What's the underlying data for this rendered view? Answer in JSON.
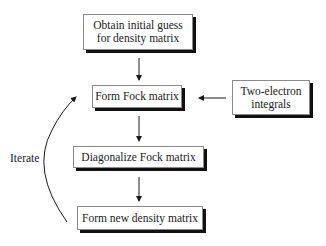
{
  "diagram": {
    "type": "flowchart",
    "nodes": [
      {
        "id": "initial",
        "lines": [
          "Obtain initial guess",
          "for density matrix"
        ]
      },
      {
        "id": "fock",
        "lines": [
          "Form Fock matrix"
        ]
      },
      {
        "id": "twoel",
        "lines": [
          "Two-electron",
          "integrals"
        ]
      },
      {
        "id": "diag",
        "lines": [
          "Diagonalize Fock matrix"
        ]
      },
      {
        "id": "newdens",
        "lines": [
          "Form new density matrix"
        ]
      }
    ],
    "edges": [
      {
        "from": "initial",
        "to": "fock"
      },
      {
        "from": "twoel",
        "to": "fock"
      },
      {
        "from": "fock",
        "to": "diag"
      },
      {
        "from": "diag",
        "to": "newdens"
      },
      {
        "from": "newdens",
        "to": "fock",
        "label": "Iterate"
      }
    ],
    "loop_label": "Iterate",
    "colors": {
      "box_border": "#8a8a8a",
      "box_shadow": "#111111",
      "line": "#1a1a1a",
      "background": "#ffffff"
    }
  }
}
